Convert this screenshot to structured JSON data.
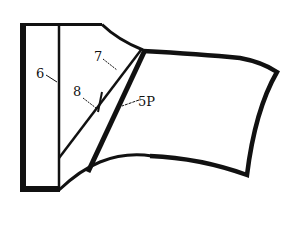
{
  "diagram": {
    "background": "#ffffff",
    "stroke_color": "#111111",
    "labels": [
      {
        "id": "6",
        "text": "6"
      },
      {
        "id": "7",
        "text": "7"
      },
      {
        "id": "8",
        "text": "8"
      },
      {
        "id": "5P",
        "text": "5P"
      }
    ]
  }
}
